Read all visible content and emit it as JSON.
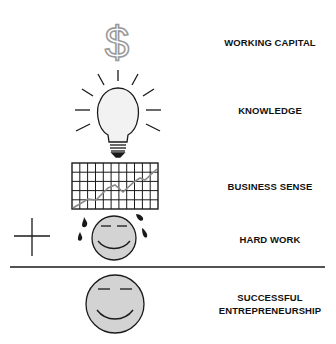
{
  "diagram": {
    "rows": [
      {
        "id": "working-capital",
        "label": "WORKING CAPITAL",
        "icon": "dollar-sign-icon"
      },
      {
        "id": "knowledge",
        "label": "KNOWLEDGE",
        "icon": "light-bulb-icon"
      },
      {
        "id": "business-sense",
        "label": "BUSINESS SENSE",
        "icon": "grid-chart-icon"
      },
      {
        "id": "hard-work",
        "label": "HARD WORK",
        "icon": "sweating-smiley-icon"
      }
    ],
    "operator": "+",
    "result": {
      "line1": "SUCCESSFUL",
      "line2": "ENTREPRENEURSHIP",
      "icon": "smiley-face-icon"
    },
    "colors": {
      "icon_fill": "#d3d3d3",
      "stroke": "#1a1a1a",
      "dollar": "#9a9a9a"
    }
  }
}
